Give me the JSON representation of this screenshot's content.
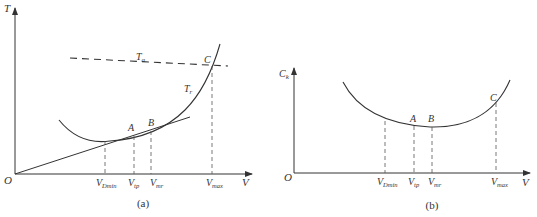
{
  "figure_a": {
    "caption": "(a)",
    "y_axis_label": "T",
    "x_axis_label": "V",
    "origin_label": "O",
    "curves": {
      "available_thrust": "Ta",
      "required_thrust": "Tr"
    },
    "points": {
      "A": "A",
      "B": "B",
      "C": "C"
    },
    "x_ticks": {
      "v_dmin": {
        "base": "V",
        "sub": "Dmin"
      },
      "v_tp": {
        "base": "V",
        "sub": "tp"
      },
      "v_mr": {
        "base": "V",
        "sub": "mr"
      },
      "v_max": {
        "base": "V",
        "sub": "max"
      }
    },
    "labels": {
      "Ta_base": "T",
      "Ta_sub": "a",
      "Tr_base": "T",
      "Tr_sub": "r"
    }
  },
  "figure_b": {
    "caption": "(b)",
    "y_axis_label": {
      "base": "C",
      "sub": "k"
    },
    "x_axis_label": "V",
    "origin_label": "O",
    "points": {
      "A": "A",
      "B": "B",
      "C": "C"
    },
    "x_ticks": {
      "v_dmin": {
        "base": "V",
        "sub": "Dmin"
      },
      "v_tp": {
        "base": "V",
        "sub": "tp"
      },
      "v_mr": {
        "base": "V",
        "sub": "mr"
      },
      "v_max": {
        "base": "V",
        "sub": "max"
      }
    }
  },
  "colors": {
    "line": "#333333",
    "background": "#ffffff"
  }
}
